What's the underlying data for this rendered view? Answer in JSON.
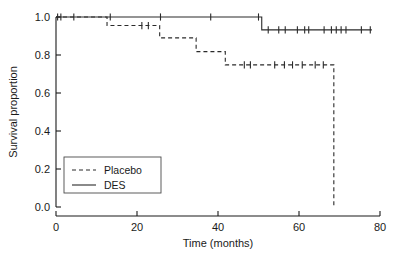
{
  "chart_data": {
    "type": "line",
    "title": "",
    "xlabel": "Time (months)",
    "ylabel": "Survival proportion",
    "xlim": [
      0,
      80
    ],
    "ylim": [
      0.0,
      1.0
    ],
    "xticks": [
      0,
      20,
      40,
      60,
      80
    ],
    "xticklabels": [
      "0",
      "20",
      "40",
      "60",
      "80"
    ],
    "yticks": [
      0.0,
      0.2,
      0.4,
      0.6,
      0.8,
      1.0
    ],
    "yticklabels": [
      "0.0",
      "0.2",
      "0.4",
      "0.6",
      "0.8",
      "1.0"
    ],
    "grid": false,
    "legend_position": "lower left",
    "series": [
      {
        "name": "Placebo",
        "style": "dashed",
        "color": "#2a2a2a",
        "steps": [
          {
            "t": 0.0,
            "s": 1.0
          },
          {
            "t": 12.6,
            "s": 1.0
          },
          {
            "t": 12.6,
            "s": 0.955
          },
          {
            "t": 25.6,
            "s": 0.955
          },
          {
            "t": 25.6,
            "s": 0.89
          },
          {
            "t": 34.6,
            "s": 0.89
          },
          {
            "t": 34.6,
            "s": 0.818
          },
          {
            "t": 41.8,
            "s": 0.818
          },
          {
            "t": 41.8,
            "s": 0.748
          },
          {
            "t": 68.6,
            "s": 0.748
          },
          {
            "t": 68.6,
            "s": 0.0
          }
        ],
        "censor_times": [
          21.2,
          22.8,
          46.5,
          48.0,
          54.0,
          56.4,
          58.4,
          60.8,
          64.0,
          66.0
        ]
      },
      {
        "name": "DES",
        "style": "solid",
        "color": "#2a2a2a",
        "steps": [
          {
            "t": 0.0,
            "s": 1.0
          },
          {
            "t": 50.8,
            "s": 1.0
          },
          {
            "t": 50.8,
            "s": 0.932
          },
          {
            "t": 78.0,
            "s": 0.932
          }
        ],
        "censor_times": [
          0.4,
          1.2,
          4.4,
          13.4,
          25.8,
          38.2,
          50.0,
          52.4,
          55.0,
          56.6,
          59.6,
          61.4,
          62.4,
          66.2,
          68.0,
          69.2,
          70.4,
          71.6,
          75.4,
          77.6
        ]
      }
    ]
  },
  "axes": {
    "x_label": "Time (months)",
    "y_label": "Survival proportion"
  },
  "legend": {
    "entries": [
      {
        "label": "Placebo",
        "style": "dashed"
      },
      {
        "label": "DES",
        "style": "solid"
      }
    ]
  }
}
